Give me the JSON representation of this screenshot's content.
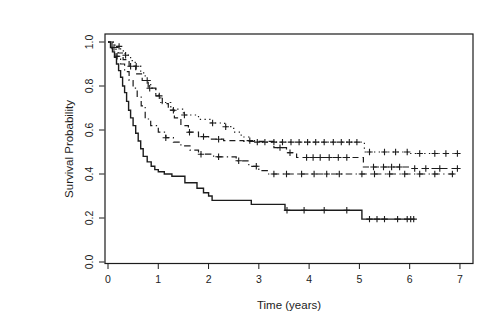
{
  "chart_data": {
    "type": "line",
    "kind": "kaplan-meier-step-curves",
    "title": "",
    "xlabel": "Time (years)",
    "ylabel": "Survival Probability",
    "xlim": [
      0,
      7
    ],
    "ylim": [
      0.0,
      1.0
    ],
    "x_ticks": [
      "0",
      "1",
      "2",
      "3",
      "4",
      "5",
      "6",
      "7"
    ],
    "y_ticks": [
      "0.0",
      "0.2",
      "0.4",
      "0.6",
      "0.8",
      "1.0"
    ],
    "grid": false,
    "legend_position": "none",
    "censor_marker": "plus-sign",
    "frame_color": "#1c1c1c",
    "curve_color": "#1c1c1c",
    "series": [
      {
        "name": "solid-group",
        "line_style": "solid",
        "color": "#1c1c1c",
        "end_time": 6.1,
        "points": [
          [
            0,
            1.0
          ],
          [
            0.05,
            0.975
          ],
          [
            0.09,
            0.955
          ],
          [
            0.13,
            0.93
          ],
          [
            0.17,
            0.9
          ],
          [
            0.21,
            0.87
          ],
          [
            0.25,
            0.84
          ],
          [
            0.29,
            0.8
          ],
          [
            0.33,
            0.77
          ],
          [
            0.37,
            0.73
          ],
          [
            0.41,
            0.69
          ],
          [
            0.45,
            0.655
          ],
          [
            0.5,
            0.62
          ],
          [
            0.55,
            0.585
          ],
          [
            0.6,
            0.55
          ],
          [
            0.65,
            0.515
          ],
          [
            0.7,
            0.48
          ],
          [
            0.78,
            0.455
          ],
          [
            0.86,
            0.435
          ],
          [
            0.93,
            0.42
          ],
          [
            1.0,
            0.41
          ],
          [
            1.12,
            0.4
          ],
          [
            1.27,
            0.39
          ],
          [
            1.53,
            0.36
          ],
          [
            1.77,
            0.335
          ],
          [
            1.9,
            0.315
          ],
          [
            2.0,
            0.3
          ],
          [
            2.07,
            0.28
          ],
          [
            2.85,
            0.262
          ],
          [
            3.52,
            0.235
          ],
          [
            5.05,
            0.195
          ]
        ],
        "censor_times": [
          3.56,
          3.9,
          4.3,
          4.75,
          5.2,
          5.35,
          5.5,
          5.76,
          5.95,
          6.02,
          6.08
        ]
      },
      {
        "name": "dotdash-group",
        "line_style": "dotdash",
        "color": "#1c1c1c",
        "end_time": 6.88,
        "points": [
          [
            0,
            1.0
          ],
          [
            0.08,
            0.97
          ],
          [
            0.16,
            0.935
          ],
          [
            0.25,
            0.9
          ],
          [
            0.33,
            0.865
          ],
          [
            0.42,
            0.825
          ],
          [
            0.5,
            0.79
          ],
          [
            0.58,
            0.75
          ],
          [
            0.66,
            0.71
          ],
          [
            0.74,
            0.65
          ],
          [
            0.85,
            0.62
          ],
          [
            1.0,
            0.59
          ],
          [
            1.15,
            0.565
          ],
          [
            1.3,
            0.545
          ],
          [
            1.45,
            0.528
          ],
          [
            1.63,
            0.508
          ],
          [
            1.8,
            0.49
          ],
          [
            2.1,
            0.478
          ],
          [
            2.55,
            0.46
          ],
          [
            2.8,
            0.435
          ],
          [
            3.0,
            0.415
          ],
          [
            3.18,
            0.4
          ]
        ],
        "censor_times": [
          0.18,
          1.15,
          1.85,
          2.2,
          2.6,
          2.95,
          3.3,
          3.55,
          3.85,
          4.1,
          4.35,
          4.6,
          5.05,
          5.3,
          5.6,
          5.9,
          6.2,
          6.5,
          6.85
        ]
      },
      {
        "name": "dashed-group",
        "line_style": "dashed",
        "color": "#1c1c1c",
        "end_time": 7.02,
        "points": [
          [
            0,
            1.0
          ],
          [
            0.1,
            0.975
          ],
          [
            0.2,
            0.95
          ],
          [
            0.3,
            0.92
          ],
          [
            0.42,
            0.89
          ],
          [
            0.55,
            0.855
          ],
          [
            0.68,
            0.825
          ],
          [
            0.8,
            0.79
          ],
          [
            0.95,
            0.755
          ],
          [
            1.08,
            0.72
          ],
          [
            1.2,
            0.69
          ],
          [
            1.32,
            0.655
          ],
          [
            1.45,
            0.62
          ],
          [
            1.6,
            0.59
          ],
          [
            1.8,
            0.57
          ],
          [
            2.0,
            0.558
          ],
          [
            2.3,
            0.552
          ],
          [
            2.7,
            0.548
          ],
          [
            3.3,
            0.52
          ],
          [
            3.55,
            0.497
          ],
          [
            3.75,
            0.475
          ],
          [
            5.08,
            0.432
          ],
          [
            6.0,
            0.425
          ]
        ],
        "censor_times": [
          0.12,
          0.45,
          0.83,
          1.02,
          1.3,
          1.62,
          1.9,
          2.2,
          3.42,
          3.62,
          3.95,
          4.08,
          4.22,
          4.4,
          4.58,
          4.75,
          5.28,
          5.48,
          5.64,
          5.8,
          6.1,
          6.32,
          6.6,
          6.95
        ]
      },
      {
        "name": "dotted-group",
        "line_style": "dotted",
        "color": "#1c1c1c",
        "end_time": 6.97,
        "points": [
          [
            0,
            1.0
          ],
          [
            0.14,
            0.98
          ],
          [
            0.25,
            0.96
          ],
          [
            0.34,
            0.94
          ],
          [
            0.45,
            0.915
          ],
          [
            0.54,
            0.89
          ],
          [
            0.65,
            0.86
          ],
          [
            0.74,
            0.825
          ],
          [
            0.85,
            0.79
          ],
          [
            0.95,
            0.758
          ],
          [
            1.05,
            0.725
          ],
          [
            1.25,
            0.695
          ],
          [
            1.5,
            0.668
          ],
          [
            1.8,
            0.648
          ],
          [
            2.05,
            0.632
          ],
          [
            2.32,
            0.615
          ],
          [
            2.5,
            0.59
          ],
          [
            2.65,
            0.568
          ],
          [
            2.8,
            0.552
          ],
          [
            2.95,
            0.545
          ],
          [
            5.1,
            0.5
          ],
          [
            6.0,
            0.493
          ]
        ],
        "censor_times": [
          0.22,
          0.35,
          0.56,
          0.78,
          1.52,
          2.08,
          2.34,
          2.82,
          2.97,
          3.12,
          3.3,
          3.47,
          3.64,
          3.8,
          3.97,
          4.13,
          4.3,
          4.48,
          4.64,
          4.8,
          4.95,
          5.2,
          5.5,
          5.72,
          5.95,
          6.2,
          6.5,
          6.72,
          6.95
        ]
      }
    ]
  }
}
